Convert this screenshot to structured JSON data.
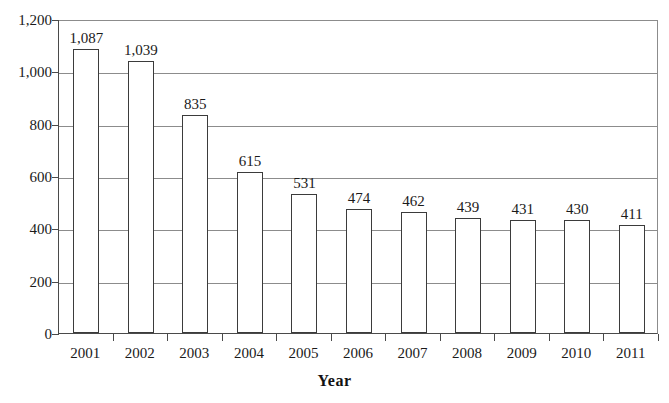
{
  "chart_data": {
    "type": "bar",
    "title": "",
    "subtitle": "",
    "xlabel": "Year",
    "ylabel": "",
    "categories": [
      "2001",
      "2002",
      "2003",
      "2004",
      "2005",
      "2006",
      "2007",
      "2008",
      "2009",
      "2010",
      "2011"
    ],
    "values": [
      1087,
      1039,
      835,
      615,
      531,
      474,
      462,
      439,
      431,
      430,
      411
    ],
    "value_labels": [
      "1,087",
      "1,039",
      "835",
      "615",
      "531",
      "474",
      "462",
      "439",
      "431",
      "430",
      "411"
    ],
    "ylim": [
      0,
      1200
    ],
    "y_ticks": [
      0,
      200,
      400,
      600,
      800,
      1000,
      1200
    ],
    "y_tick_labels": [
      "0",
      "200",
      "400",
      "600",
      "800",
      "1,000",
      "1,200"
    ],
    "grid": true,
    "grid_axis": "y",
    "legend": false,
    "legend_position": "none",
    "bar_fill_color": "#ffffff",
    "bar_border_color": "#3b3b3b",
    "grid_color": "#8c8c8c",
    "axis_color": "#4a4a4a",
    "text_color": "#1a1a1a",
    "background_color": "#ffffff",
    "data_labels_shown": true
  }
}
